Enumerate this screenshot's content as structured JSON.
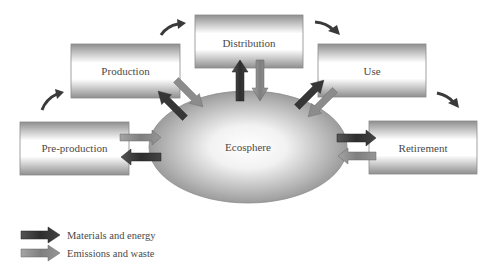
{
  "diagram": {
    "title": "",
    "center": {
      "label": "Ecosphere"
    },
    "stages": [
      {
        "id": "pre-production",
        "label": "Pre-production"
      },
      {
        "id": "production",
        "label": "Production"
      },
      {
        "id": "distribution",
        "label": "Distribution"
      },
      {
        "id": "use",
        "label": "Use"
      },
      {
        "id": "retirement",
        "label": "Retirement"
      }
    ],
    "flow_sequence": [
      "Pre-production",
      "Production",
      "Distribution",
      "Use",
      "Retirement"
    ],
    "exchanges": [
      {
        "stage": "Pre-production",
        "materials_and_energy": "from Ecosphere",
        "emissions_and_waste": "to Ecosphere"
      },
      {
        "stage": "Production",
        "materials_and_energy": "from Ecosphere",
        "emissions_and_waste": "to Ecosphere"
      },
      {
        "stage": "Distribution",
        "materials_and_energy": "from Ecosphere",
        "emissions_and_waste": "to Ecosphere"
      },
      {
        "stage": "Use",
        "materials_and_energy": "from Ecosphere",
        "emissions_and_waste": "to Ecosphere"
      },
      {
        "stage": "Retirement",
        "materials_and_energy": "from Ecosphere",
        "emissions_and_waste": "to Ecosphere"
      }
    ]
  },
  "legend": {
    "items": [
      {
        "label": "Materials and energy",
        "color": "#3a3a3a"
      },
      {
        "label": "Emissions and waste",
        "color": "#8c8c8c"
      }
    ]
  },
  "colors": {
    "dark_arrow": "#3a3a3a",
    "light_arrow": "#8c8c8c",
    "box_border": "#8a8a8a",
    "ellipse_edge": "#8e8e8e"
  }
}
